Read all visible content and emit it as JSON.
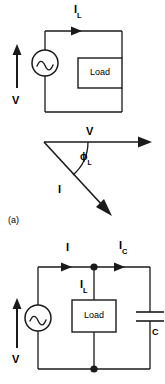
{
  "figure": {
    "part_label": "(a)"
  },
  "top_circuit": {
    "source_label": "V",
    "load_label": "Load",
    "branch_current_label": "I",
    "branch_current_sub": "L"
  },
  "phasor": {
    "voltage_label": "V",
    "current_label": "I",
    "angle_label": "ϕ",
    "angle_sub": "L"
  },
  "bottom_circuit": {
    "source_label": "V",
    "load_label": "Load",
    "line_current_label": "I",
    "load_current_label": "I",
    "load_current_sub": "L",
    "cap_current_label": "I",
    "cap_current_sub": "C",
    "capacitor_label": "C"
  },
  "colors": {
    "ink": "#1a1a1a",
    "background": "#ffffff"
  }
}
